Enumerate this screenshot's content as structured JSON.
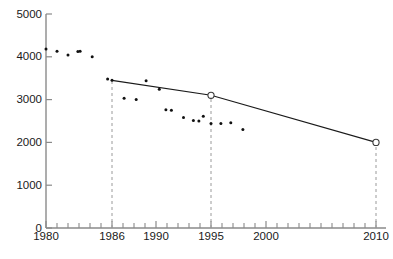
{
  "chart_data": {
    "type": "scatter",
    "title": "",
    "subtitle": "",
    "xlabel": "",
    "ylabel": "",
    "xlim": [
      1980,
      2010
    ],
    "ylim": [
      0,
      5000
    ],
    "grid": false,
    "legend": null,
    "x_ticks": [
      1980,
      1986,
      1990,
      1995,
      2000,
      2010
    ],
    "x_tick_labels": [
      "1980",
      "1986",
      "1990",
      "1995",
      "2000",
      "2010"
    ],
    "x_minor_tick_step": 1,
    "y_ticks": [
      0,
      1000,
      2000,
      3000,
      4000,
      5000
    ],
    "y_tick_labels": [
      "0",
      "1000",
      "2000",
      "3000",
      "4000",
      "5000"
    ],
    "series": [
      {
        "name": "observations",
        "type": "scatter",
        "marker": "dot",
        "color": "#111111",
        "points": [
          {
            "x": 1980.0,
            "y": 4180
          },
          {
            "x": 1981.0,
            "y": 4130
          },
          {
            "x": 1982.0,
            "y": 4040
          },
          {
            "x": 1983.1,
            "y": 4130
          },
          {
            "x": 1984.2,
            "y": 4000
          },
          {
            "x": 1985.6,
            "y": 3480
          },
          {
            "x": 1986.0,
            "y": 3450
          },
          {
            "x": 1987.1,
            "y": 3030
          },
          {
            "x": 1988.2,
            "y": 3000
          },
          {
            "x": 1989.1,
            "y": 3440
          },
          {
            "x": 1990.3,
            "y": 3240
          },
          {
            "x": 1991.4,
            "y": 2750
          },
          {
            "x": 1992.5,
            "y": 2580
          },
          {
            "x": 1993.4,
            "y": 2510
          },
          {
            "x": 1994.3,
            "y": 2610
          },
          {
            "x": 1995.0,
            "y": 2440
          },
          {
            "x": 1995.9,
            "y": 2440
          },
          {
            "x": 1996.8,
            "y": 2460
          },
          {
            "x": 1997.9,
            "y": 2300
          },
          {
            "x": 1982.9,
            "y": 4125
          },
          {
            "x": 1990.9,
            "y": 2760
          },
          {
            "x": 1993.9,
            "y": 2500
          }
        ]
      },
      {
        "name": "trend",
        "type": "line",
        "color": "#1a1a1a",
        "nodes": [
          {
            "x": 1986,
            "y": 3450,
            "marker": "none"
          },
          {
            "x": 1995,
            "y": 3100,
            "marker": "open-circle"
          },
          {
            "x": 2010,
            "y": 2000,
            "marker": "open-circle"
          }
        ]
      }
    ],
    "droplines": [
      {
        "x": 1986,
        "from_y": 0,
        "to_y": 3450
      },
      {
        "x": 1995,
        "from_y": 0,
        "to_y": 3100
      },
      {
        "x": 2010,
        "from_y": 0,
        "to_y": 2000
      }
    ],
    "colors": {
      "axis": "#8a8a8a",
      "point": "#111111",
      "trend": "#1a1a1a",
      "dropline": "#9a9a9a",
      "background": "#ffffff"
    }
  }
}
